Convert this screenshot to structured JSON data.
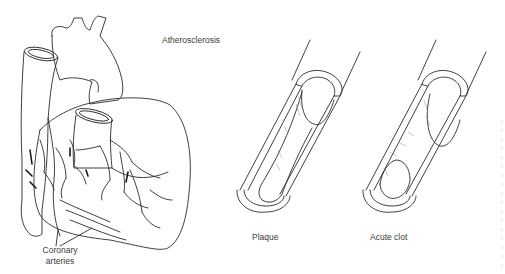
{
  "diagram": {
    "title": "Atherosclerosis",
    "heart": {
      "label_line1": "Coronary",
      "label_line2": "arteries"
    },
    "vessels": [
      {
        "label": "Plaque"
      },
      {
        "label": "Acute clot"
      }
    ]
  }
}
